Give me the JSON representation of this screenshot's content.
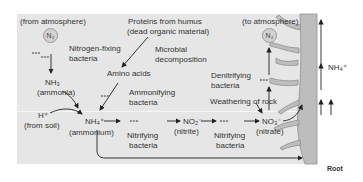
{
  "diagram": {
    "colors": {
      "panel": "#e6e6e6",
      "root": "#b8b8b8",
      "arrow": "#222222",
      "bubble": "#d2d2d2"
    },
    "nodes": {
      "from_atmosphere": "(from atmosphere)",
      "n2_left": "N₂",
      "nitrogen_fixing": [
        "Nitrogen-fixing",
        "bacteria"
      ],
      "nh3": "NH₃",
      "ammonia": "(ammonia)",
      "proteins": [
        "Proteins from humus",
        "(dead organic material)"
      ],
      "microbial_decomposition": [
        "Microbial",
        "decomposition"
      ],
      "amino_acids": "Amino acids",
      "ammonifying": [
        "Ammonifying",
        "bacteria"
      ],
      "h_plus": "H⁺",
      "from_soil": "(from soil)",
      "nh4": "NH₄⁺",
      "ammonium": "(ammonium)",
      "nitrifying_1": [
        "Nitrifying",
        "bacteria"
      ],
      "no2": "NO₂⁻",
      "nitrite": "(nitrite)",
      "nitrifying_2": [
        "Nitrifying",
        "bacteria"
      ],
      "no3": "NO₃⁻",
      "nitrate": "(nitrate)",
      "weathering": "Weathering of rock",
      "denitrifying": [
        "Denitrifying",
        "bacteria"
      ],
      "to_atmosphere": "(to atmosphere)",
      "n2_right": "N₂",
      "nh4_root": "NH₄⁺",
      "root": "Root"
    },
    "icons": {
      "bacteria": "∘∘∘"
    }
  }
}
